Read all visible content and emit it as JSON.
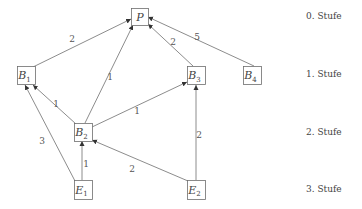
{
  "diagram": {
    "nodes": [
      {
        "id": "P",
        "base": "P",
        "sub": "",
        "x": 131,
        "y": 8,
        "w": 17,
        "h": 17
      },
      {
        "id": "B1",
        "base": "B",
        "sub": "1",
        "x": 17,
        "y": 66,
        "w": 18,
        "h": 18
      },
      {
        "id": "B3",
        "base": "B",
        "sub": "3",
        "x": 187,
        "y": 66,
        "w": 18,
        "h": 18
      },
      {
        "id": "B4",
        "base": "B",
        "sub": "4",
        "x": 243,
        "y": 66,
        "w": 18,
        "h": 18
      },
      {
        "id": "B2",
        "base": "B",
        "sub": "2",
        "x": 74,
        "y": 123,
        "w": 18,
        "h": 18
      },
      {
        "id": "E1",
        "base": "E",
        "sub": "1",
        "x": 74,
        "y": 180,
        "w": 18,
        "h": 19
      },
      {
        "id": "E2",
        "base": "E",
        "sub": "2",
        "x": 187,
        "y": 180,
        "w": 18,
        "h": 19
      }
    ],
    "edges": [
      {
        "from": "B1",
        "to": "P",
        "weight": "2",
        "x1": 33,
        "y1": 67,
        "x2": 131,
        "y2": 19,
        "lx": 72,
        "ly": 39
      },
      {
        "from": "B2",
        "to": "P",
        "weight": "1",
        "x1": 85,
        "y1": 123,
        "x2": 133,
        "y2": 25,
        "lx": 110,
        "ly": 77
      },
      {
        "from": "B3",
        "to": "P",
        "weight": "2",
        "x1": 193,
        "y1": 66,
        "x2": 148,
        "y2": 24,
        "lx": 173,
        "ly": 42
      },
      {
        "from": "B4",
        "to": "P",
        "weight": "5",
        "x1": 254,
        "y1": 66,
        "x2": 148,
        "y2": 17,
        "lx": 197,
        "ly": 37
      },
      {
        "from": "B2",
        "to": "B1",
        "weight": "1",
        "x1": 76,
        "y1": 124,
        "x2": 33,
        "y2": 85,
        "lx": 56,
        "ly": 104
      },
      {
        "from": "E1",
        "to": "B1",
        "weight": "3",
        "x1": 75,
        "y1": 181,
        "x2": 25,
        "y2": 85,
        "lx": 42,
        "ly": 141
      },
      {
        "from": "B2",
        "to": "B3",
        "weight": "1",
        "x1": 92,
        "y1": 127,
        "x2": 187,
        "y2": 82,
        "lx": 137,
        "ly": 111
      },
      {
        "from": "E1",
        "to": "B2",
        "weight": "1",
        "x1": 82,
        "y1": 180,
        "x2": 82,
        "y2": 141,
        "lx": 86,
        "ly": 164
      },
      {
        "from": "E2",
        "to": "B2",
        "weight": "2",
        "x1": 188,
        "y1": 181,
        "x2": 92,
        "y2": 140,
        "lx": 132,
        "ly": 169
      },
      {
        "from": "E2",
        "to": "B3",
        "weight": "2",
        "x1": 196,
        "y1": 180,
        "x2": 196,
        "y2": 85,
        "lx": 199,
        "ly": 135
      }
    ],
    "levels": [
      {
        "label": "0. Stufe",
        "y": 11
      },
      {
        "label": "1. Stufe",
        "y": 69
      },
      {
        "label": "2. Stufe",
        "y": 127
      },
      {
        "label": "3. Stufe",
        "y": 184
      }
    ]
  }
}
